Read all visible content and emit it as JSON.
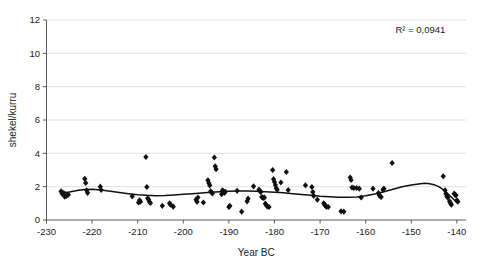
{
  "chart_data": {
    "type": "scatter",
    "title": "",
    "xlabel": "Year BC",
    "ylabel": "shekel/kurru",
    "xlim": [
      -230,
      -138
    ],
    "ylim": [
      0,
      12
    ],
    "xticks": [
      -230,
      -220,
      -210,
      -200,
      -190,
      -180,
      -170,
      -160,
      -150,
      -140
    ],
    "yticks": [
      0,
      2,
      4,
      6,
      8,
      10,
      12
    ],
    "xtick_labels": [
      "-230",
      "-220",
      "-210",
      "-200",
      "-190",
      "-180",
      "-170",
      "-160",
      "-150",
      "-140"
    ],
    "ytick_labels": [
      "0",
      "2",
      "4",
      "6",
      "8",
      "10",
      "12"
    ],
    "grid": "horizontal",
    "legend": "none",
    "annotations": [
      {
        "name": "r-squared",
        "text": "R² = 0,0941",
        "x": -148,
        "y": 11.2
      }
    ],
    "marker": {
      "shape": "diamond",
      "color": "#111111",
      "size": 3.1
    },
    "series": [
      {
        "name": "shekel per kurru observations",
        "points": [
          [
            -226.8,
            1.72
          ],
          [
            -226.5,
            1.55
          ],
          [
            -226.2,
            1.62
          ],
          [
            -226.0,
            1.4
          ],
          [
            -225.6,
            1.45
          ],
          [
            -225.2,
            1.52
          ],
          [
            -221.6,
            2.47
          ],
          [
            -221.4,
            2.22
          ],
          [
            -221.2,
            1.78
          ],
          [
            -221.0,
            1.63
          ],
          [
            -218.2,
            2.0
          ],
          [
            -218.0,
            1.8
          ],
          [
            -211.2,
            1.42
          ],
          [
            -209.8,
            1.05
          ],
          [
            -209.6,
            1.18
          ],
          [
            -209.4,
            1.1
          ],
          [
            -208.2,
            3.78
          ],
          [
            -208.0,
            1.98
          ],
          [
            -207.8,
            1.3
          ],
          [
            -207.6,
            1.22
          ],
          [
            -207.4,
            1.08
          ],
          [
            -207.2,
            1.02
          ],
          [
            -204.6,
            0.85
          ],
          [
            -203.0,
            1.0
          ],
          [
            -202.8,
            0.92
          ],
          [
            -202.2,
            0.8
          ],
          [
            -197.2,
            1.22
          ],
          [
            -197.0,
            1.1
          ],
          [
            -196.8,
            1.35
          ],
          [
            -195.6,
            1.05
          ],
          [
            -194.6,
            2.38
          ],
          [
            -194.4,
            2.22
          ],
          [
            -194.2,
            2.08
          ],
          [
            -194.0,
            1.72
          ],
          [
            -193.8,
            1.65
          ],
          [
            -193.6,
            1.6
          ],
          [
            -193.2,
            3.75
          ],
          [
            -193.0,
            3.22
          ],
          [
            -192.8,
            3.05
          ],
          [
            -191.6,
            1.55
          ],
          [
            -191.4,
            1.78
          ],
          [
            -191.2,
            1.7
          ],
          [
            -191.0,
            1.62
          ],
          [
            -190.8,
            1.7
          ],
          [
            -190.0,
            0.78
          ],
          [
            -189.8,
            0.85
          ],
          [
            -188.2,
            1.75
          ],
          [
            -187.2,
            0.5
          ],
          [
            -186.0,
            1.12
          ],
          [
            -185.8,
            1.28
          ],
          [
            -184.6,
            2.02
          ],
          [
            -183.4,
            1.82
          ],
          [
            -183.2,
            1.75
          ],
          [
            -183.0,
            1.68
          ],
          [
            -182.8,
            1.38
          ],
          [
            -182.6,
            1.35
          ],
          [
            -182.4,
            1.32
          ],
          [
            -182.2,
            1.35
          ],
          [
            -182.0,
            0.98
          ],
          [
            -181.8,
            0.9
          ],
          [
            -181.6,
            0.82
          ],
          [
            -181.2,
            0.78
          ],
          [
            -180.4,
            3.0
          ],
          [
            -180.2,
            2.45
          ],
          [
            -180.0,
            2.28
          ],
          [
            -179.8,
            2.1
          ],
          [
            -179.6,
            1.9
          ],
          [
            -179.4,
            1.82
          ],
          [
            -178.6,
            2.25
          ],
          [
            -177.4,
            2.88
          ],
          [
            -177.0,
            1.8
          ],
          [
            -173.2,
            2.08
          ],
          [
            -171.8,
            1.98
          ],
          [
            -171.6,
            1.68
          ],
          [
            -171.4,
            1.45
          ],
          [
            -170.6,
            1.22
          ],
          [
            -169.2,
            1.0
          ],
          [
            -169.0,
            0.92
          ],
          [
            -168.8,
            0.85
          ],
          [
            -168.6,
            0.8
          ],
          [
            -168.2,
            0.78
          ],
          [
            -165.4,
            0.52
          ],
          [
            -164.8,
            0.5
          ],
          [
            -163.4,
            2.55
          ],
          [
            -163.2,
            2.4
          ],
          [
            -163.0,
            1.95
          ],
          [
            -162.6,
            1.92
          ],
          [
            -162.0,
            1.92
          ],
          [
            -161.4,
            1.88
          ],
          [
            -161.0,
            1.35
          ],
          [
            -158.4,
            1.88
          ],
          [
            -157.2,
            1.62
          ],
          [
            -157.0,
            1.48
          ],
          [
            -156.8,
            1.42
          ],
          [
            -156.6,
            1.38
          ],
          [
            -156.2,
            1.82
          ],
          [
            -156.0,
            1.88
          ],
          [
            -154.2,
            3.42
          ],
          [
            -143.0,
            2.62
          ],
          [
            -142.6,
            1.78
          ],
          [
            -142.4,
            1.58
          ],
          [
            -142.2,
            1.42
          ],
          [
            -142.0,
            1.35
          ],
          [
            -141.6,
            1.12
          ],
          [
            -141.4,
            1.0
          ],
          [
            -141.2,
            0.92
          ],
          [
            -140.6,
            1.58
          ],
          [
            -140.4,
            1.52
          ],
          [
            -140.2,
            1.48
          ],
          [
            -140.0,
            1.18
          ],
          [
            -139.8,
            1.1
          ]
        ]
      }
    ],
    "trend": {
      "name": "polynomial trend line",
      "color": "#111111",
      "points": [
        [
          -227.0,
          1.62
        ],
        [
          -225.0,
          1.68
        ],
        [
          -223.0,
          1.78
        ],
        [
          -221.5,
          1.83
        ],
        [
          -220.0,
          1.84
        ],
        [
          -218.0,
          1.8
        ],
        [
          -216.0,
          1.73
        ],
        [
          -214.0,
          1.65
        ],
        [
          -212.0,
          1.58
        ],
        [
          -210.0,
          1.52
        ],
        [
          -208.0,
          1.48
        ],
        [
          -206.0,
          1.46
        ],
        [
          -204.0,
          1.47
        ],
        [
          -202.0,
          1.5
        ],
        [
          -200.0,
          1.54
        ],
        [
          -198.0,
          1.58
        ],
        [
          -196.0,
          1.62
        ],
        [
          -194.0,
          1.66
        ],
        [
          -192.0,
          1.7
        ],
        [
          -190.0,
          1.72
        ],
        [
          -188.0,
          1.74
        ],
        [
          -186.0,
          1.74
        ],
        [
          -184.0,
          1.73
        ],
        [
          -182.0,
          1.7
        ],
        [
          -180.0,
          1.67
        ],
        [
          -178.0,
          1.63
        ],
        [
          -176.0,
          1.58
        ],
        [
          -174.0,
          1.53
        ],
        [
          -172.0,
          1.48
        ],
        [
          -170.0,
          1.43
        ],
        [
          -168.0,
          1.4
        ],
        [
          -166.0,
          1.37
        ],
        [
          -164.0,
          1.36
        ],
        [
          -162.0,
          1.38
        ],
        [
          -160.0,
          1.45
        ],
        [
          -158.0,
          1.56
        ],
        [
          -156.0,
          1.7
        ],
        [
          -154.0,
          1.85
        ],
        [
          -152.0,
          1.99
        ],
        [
          -150.0,
          2.1
        ],
        [
          -148.0,
          2.18
        ],
        [
          -147.0,
          2.2
        ],
        [
          -146.0,
          2.18
        ],
        [
          -145.0,
          2.12
        ],
        [
          -144.0,
          2.0
        ],
        [
          -143.0,
          1.82
        ],
        [
          -142.0,
          1.58
        ],
        [
          -141.0,
          1.32
        ],
        [
          -140.2,
          1.1
        ]
      ]
    }
  }
}
